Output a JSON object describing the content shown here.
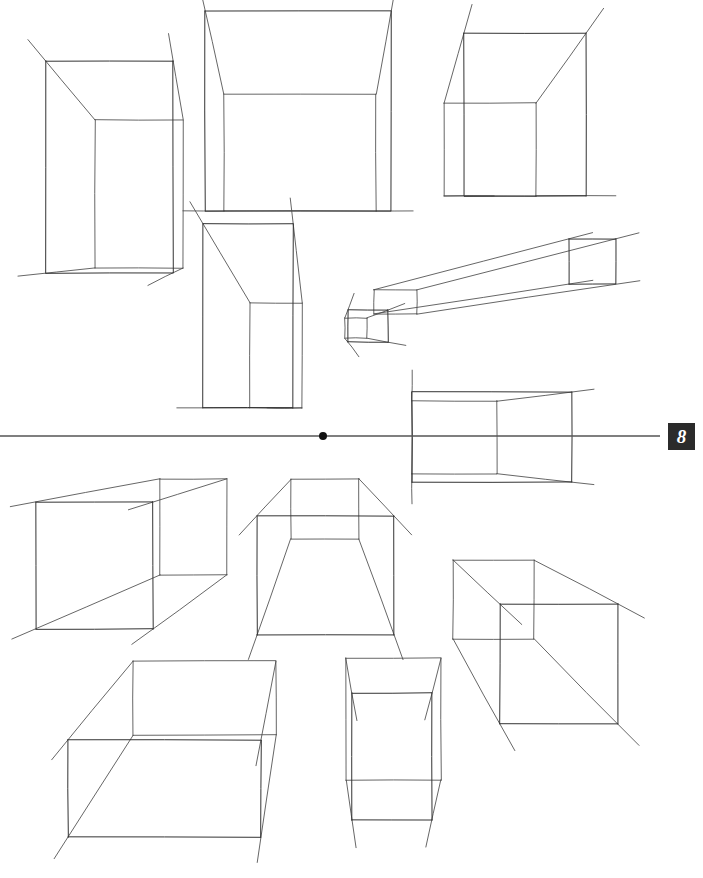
{
  "page": {
    "width": 703,
    "height": 878,
    "background_color": "#ffffff",
    "page_number": "8",
    "badge_color": "#2b2b2b",
    "badge_text_color": "#ffffff",
    "badge_position": {
      "x": 668,
      "y": 423
    }
  },
  "drawing": {
    "title": "One-Point Perspective Box Study",
    "description": "Twelve freehand wireframe rectangular boxes arranged around a single central vanishing point on a horizontal horizon line.",
    "ink_color": "#4a4a4a",
    "ink_color_dark": "#333333",
    "stroke_width": 1,
    "horizon": {
      "name": "horizon-line",
      "y": 436,
      "x_start": 0,
      "x_end": 660,
      "color": "#555555",
      "stroke_width": 1.4
    },
    "vanishing_point": {
      "name": "vanishing-point",
      "x": 323,
      "y": 436,
      "radius": 4,
      "color": "#111111"
    },
    "boxes": [
      {
        "id": "box-top-left",
        "label": "Upright box, upper left",
        "front_face": {
          "x": 46,
          "y": 61,
          "w": 127,
          "h": 212
        },
        "back_face": {
          "x": 95,
          "y": 120,
          "w": 88,
          "h": 148
        },
        "overshoot": 28
      },
      {
        "id": "box-top-center",
        "label": "Large box seen from below, top center",
        "front_face": {
          "x": 205,
          "y": 11,
          "w": 186,
          "h": 200
        },
        "back_face": {
          "x": 224,
          "y": 94,
          "w": 152,
          "h": 117
        },
        "overshoot": 22
      },
      {
        "id": "box-top-right",
        "label": "Cube seen from below, upper right",
        "front_face": {
          "x": 464,
          "y": 33,
          "w": 122,
          "h": 163
        },
        "back_face": {
          "x": 444,
          "y": 103,
          "w": 92,
          "h": 93
        },
        "overshoot": 30
      },
      {
        "id": "box-mid-left-tall",
        "label": "Tall narrow box, middle left",
        "front_face": {
          "x": 203,
          "y": 224,
          "w": 90,
          "h": 184
        },
        "back_face": {
          "x": 250,
          "y": 303,
          "w": 52,
          "h": 105
        },
        "overshoot": 26
      },
      {
        "id": "box-mid-right-slab",
        "label": "Flat wide slab, middle right",
        "front_face": {
          "x": 569,
          "y": 239,
          "w": 47,
          "h": 45
        },
        "back_face": {
          "x": 374,
          "y": 290,
          "w": 43,
          "h": 24
        },
        "overshoot": 24
      },
      {
        "id": "box-left-of-slab",
        "label": "Narrow sliver at left of slab",
        "front_face": {
          "x": 348,
          "y": 310,
          "w": 40,
          "h": 32
        },
        "back_face": {
          "x": 345,
          "y": 318,
          "w": 22,
          "h": 20
        },
        "overshoot": 18
      },
      {
        "id": "box-horizon-right",
        "label": "Box straddling the horizon line, right of vanishing point",
        "front_face": {
          "x": 412,
          "y": 392,
          "w": 160,
          "h": 90
        },
        "back_face": {
          "x": 412,
          "y": 401,
          "w": 85,
          "h": 73
        },
        "overshoot": 22
      },
      {
        "id": "box-lower-left-long",
        "label": "Long horizontal box, lower left",
        "front_face": {
          "x": 36,
          "y": 502,
          "w": 117,
          "h": 127
        },
        "back_face": {
          "x": 160,
          "y": 479,
          "w": 67,
          "h": 96
        },
        "overshoot": 26
      },
      {
        "id": "box-lower-center-interior",
        "label": "Interior-view box below vanishing point, lower center",
        "front_face": {
          "x": 257,
          "y": 516,
          "w": 137,
          "h": 119
        },
        "back_face": {
          "x": 291,
          "y": 479,
          "w": 68,
          "h": 60
        },
        "overshoot": 26
      },
      {
        "id": "box-lower-right",
        "label": "Box with small back face, lower right",
        "front_face": {
          "x": 500,
          "y": 604,
          "w": 118,
          "h": 120
        },
        "back_face": {
          "x": 453,
          "y": 560,
          "w": 81,
          "h": 79
        },
        "overshoot": 30
      },
      {
        "id": "box-bottom-left",
        "label": "Wide box seen from above, bottom left",
        "front_face": {
          "x": 68,
          "y": 740,
          "w": 193,
          "h": 97
        },
        "back_face": {
          "x": 133,
          "y": 661,
          "w": 143,
          "h": 74
        },
        "overshoot": 26
      },
      {
        "id": "box-bottom-center",
        "label": "Upright box, bottom center",
        "front_face": {
          "x": 352,
          "y": 693,
          "w": 80,
          "h": 127
        },
        "back_face": {
          "x": 346,
          "y": 658,
          "w": 95,
          "h": 122
        },
        "overshoot": 28
      }
    ]
  }
}
